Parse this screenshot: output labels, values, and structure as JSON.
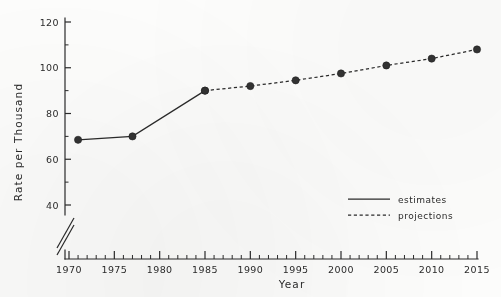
{
  "chart_data": {
    "type": "line",
    "title": "",
    "xlabel": "Year",
    "ylabel": "Rate per Thousand",
    "xlim": [
      1970,
      2015
    ],
    "ylim": [
      33,
      122
    ],
    "y_axis_break": true,
    "grid": false,
    "legend_position": "inside-right",
    "x_major_ticks": [
      1970,
      1975,
      1980,
      1985,
      1990,
      1995,
      2000,
      2005,
      2010,
      2015
    ],
    "x_major_tick_labels": [
      "1970",
      "1975",
      "1980",
      "1985",
      "1990",
      "1995",
      "2000",
      "2005",
      "2010",
      "2015"
    ],
    "x_minor_tick_step": 1,
    "y_major_ticks": [
      40,
      60,
      80,
      100,
      120
    ],
    "y_major_tick_labels": [
      "40",
      "60",
      "80",
      "100",
      "120"
    ],
    "y_minor_tick_step": 10,
    "series": [
      {
        "name": "estimates",
        "style": "solid",
        "x": [
          1971,
          1977,
          1985
        ],
        "values": [
          68.5,
          70,
          90
        ]
      },
      {
        "name": "projections",
        "style": "dashed",
        "x": [
          1985,
          1990,
          1995,
          2000,
          2005,
          2010,
          2015
        ],
        "values": [
          90,
          92,
          94.5,
          97.5,
          101,
          104,
          108
        ]
      }
    ]
  },
  "legend": {
    "items": [
      {
        "label": "estimates",
        "style": "solid"
      },
      {
        "label": "projections",
        "style": "dashed"
      }
    ]
  },
  "axes": {
    "x_title": "Year",
    "y_title": "Rate per Thousand"
  }
}
